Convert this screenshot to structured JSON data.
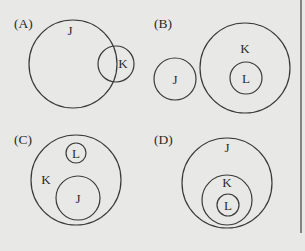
{
  "diagram": {
    "type": "venn-diagram-options",
    "colors": {
      "background": "#e8e8e6",
      "stroke": "#3a3a3a",
      "text": "#2a2a2a"
    },
    "panels": [
      {
        "label": "(A)",
        "relationship": "J and K overlap",
        "circles": [
          {
            "set": "J",
            "cx": 73,
            "cy": 64,
            "r": 44,
            "label_x": 70,
            "label_y": 35
          },
          {
            "set": "K",
            "cx": 116,
            "cy": 64,
            "r": 18,
            "label_x": 123,
            "label_y": 68
          }
        ]
      },
      {
        "label": "(B)",
        "relationship": "J disjoint from K; L inside K",
        "circles": [
          {
            "set": "J",
            "cx": 175,
            "cy": 79,
            "r": 21,
            "label_x": 175,
            "label_y": 84
          },
          {
            "set": "K",
            "cx": 245,
            "cy": 68,
            "r": 45,
            "label_x": 245,
            "label_y": 53
          },
          {
            "set": "L",
            "cx": 246,
            "cy": 78,
            "r": 16,
            "label_x": 246,
            "label_y": 83
          }
        ]
      },
      {
        "label": "(C)",
        "relationship": "L and J both inside K, disjoint from each other",
        "circles": [
          {
            "set": "K",
            "cx": 76,
            "cy": 180,
            "r": 45,
            "label_x": 46,
            "label_y": 184
          },
          {
            "set": "L",
            "cx": 76,
            "cy": 153,
            "r": 10,
            "label_x": 76,
            "label_y": 158
          },
          {
            "set": "J",
            "cx": 78,
            "cy": 198,
            "r": 22,
            "label_x": 78,
            "label_y": 203
          }
        ]
      },
      {
        "label": "(D)",
        "relationship": "L inside K inside J",
        "circles": [
          {
            "set": "J",
            "cx": 227,
            "cy": 183,
            "r": 45,
            "label_x": 227,
            "label_y": 152
          },
          {
            "set": "K",
            "cx": 227,
            "cy": 200,
            "r": 25,
            "label_x": 227,
            "label_y": 187
          },
          {
            "set": "L",
            "cx": 228,
            "cy": 205,
            "r": 11,
            "label_x": 228,
            "label_y": 210
          }
        ]
      }
    ]
  }
}
